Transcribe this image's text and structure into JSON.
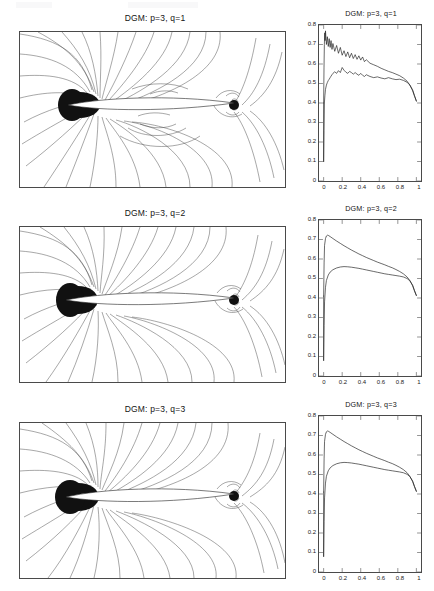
{
  "figure": {
    "rows": [
      {
        "id": "q1",
        "contour_title": "DGM: p=3, q=1",
        "line_title": "DGM: p=3, q=1"
      },
      {
        "id": "q2",
        "contour_title": "DGM: p=3, q=2",
        "line_title": "DGM: p=3, q=2"
      },
      {
        "id": "q3",
        "contour_title": "DGM: p=3, q=3",
        "line_title": "DGM: p=3, q=3"
      }
    ]
  },
  "axes": {
    "y_ticks": [
      "0.8",
      "0.7",
      "0.6",
      "0.5",
      "0.4",
      "0.3",
      "0.2",
      "0.1",
      "0"
    ],
    "x_ticks": [
      "0",
      "0.2",
      "0.4",
      "0.6",
      "0.8",
      "1"
    ]
  },
  "colors": {
    "curve": "#161616",
    "contour_line": "#3d3d3d",
    "axis": "#4a4a4a",
    "background": "#ffffff"
  },
  "chart_data": [
    {
      "type": "line",
      "title": "DGM: p=3, q=1",
      "xlabel": "",
      "ylabel": "",
      "xlim": [
        -0.05,
        1.05
      ],
      "ylim": [
        0,
        0.8
      ],
      "xticks": [
        0,
        0.2,
        0.4,
        0.6,
        0.8,
        1
      ],
      "yticks": [
        0,
        0.1,
        0.2,
        0.3,
        0.4,
        0.5,
        0.6,
        0.7,
        0.8
      ],
      "grid": false,
      "legend": "none",
      "note": "Oscillatory solution: strong sawtooth wiggles on both surfaces",
      "series": [
        {
          "name": "upper-surface",
          "x": [
            0.0,
            0.004,
            0.008,
            0.012,
            0.016,
            0.02,
            0.03,
            0.04,
            0.05,
            0.06,
            0.07,
            0.08,
            0.09,
            0.1,
            0.12,
            0.14,
            0.16,
            0.18,
            0.2,
            0.22,
            0.24,
            0.26,
            0.28,
            0.3,
            0.32,
            0.34,
            0.36,
            0.38,
            0.4,
            0.42,
            0.44,
            0.46,
            0.5,
            0.54,
            0.58,
            0.62,
            0.66,
            0.7,
            0.74,
            0.78,
            0.82,
            0.86,
            0.9,
            0.93,
            0.96,
            0.98,
            1.0
          ],
          "values": [
            0.4,
            0.58,
            0.7,
            0.76,
            0.72,
            0.77,
            0.7,
            0.74,
            0.69,
            0.73,
            0.685,
            0.72,
            0.675,
            0.705,
            0.665,
            0.695,
            0.655,
            0.685,
            0.645,
            0.668,
            0.638,
            0.662,
            0.632,
            0.655,
            0.628,
            0.648,
            0.624,
            0.642,
            0.62,
            0.636,
            0.612,
            0.622,
            0.604,
            0.596,
            0.588,
            0.578,
            0.57,
            0.562,
            0.556,
            0.548,
            0.54,
            0.528,
            0.512,
            0.492,
            0.462,
            0.435,
            0.41
          ]
        },
        {
          "name": "lower-surface",
          "x": [
            0.0,
            0.004,
            0.008,
            0.014,
            0.02,
            0.03,
            0.04,
            0.05,
            0.06,
            0.07,
            0.08,
            0.09,
            0.1,
            0.12,
            0.14,
            0.16,
            0.18,
            0.2,
            0.22,
            0.24,
            0.26,
            0.28,
            0.3,
            0.32,
            0.34,
            0.36,
            0.38,
            0.4,
            0.42,
            0.44,
            0.46,
            0.5,
            0.54,
            0.58,
            0.62,
            0.66,
            0.7,
            0.74,
            0.78,
            0.82,
            0.86,
            0.9,
            0.93,
            0.96,
            0.98,
            1.0
          ],
          "values": [
            0.1,
            0.26,
            0.4,
            0.44,
            0.47,
            0.492,
            0.505,
            0.515,
            0.522,
            0.53,
            0.538,
            0.545,
            0.552,
            0.56,
            0.552,
            0.566,
            0.556,
            0.582,
            0.568,
            0.558,
            0.552,
            0.562,
            0.556,
            0.548,
            0.556,
            0.548,
            0.542,
            0.552,
            0.542,
            0.536,
            0.545,
            0.536,
            0.53,
            0.534,
            0.528,
            0.524,
            0.53,
            0.524,
            0.52,
            0.522,
            0.516,
            0.506,
            0.492,
            0.468,
            0.438,
            0.41
          ]
        }
      ]
    },
    {
      "type": "line",
      "title": "DGM: p=3, q=2",
      "xlabel": "",
      "ylabel": "",
      "xlim": [
        -0.05,
        1.05
      ],
      "ylim": [
        0,
        0.8
      ],
      "xticks": [
        0,
        0.2,
        0.4,
        0.6,
        0.8,
        1
      ],
      "yticks": [
        0,
        0.1,
        0.2,
        0.3,
        0.4,
        0.5,
        0.6,
        0.7,
        0.8
      ],
      "grid": false,
      "legend": "none",
      "note": "Smooth monotone decay, no oscillations",
      "series": [
        {
          "name": "upper-surface",
          "x": [
            0.0,
            0.005,
            0.01,
            0.02,
            0.03,
            0.04,
            0.05,
            0.07,
            0.1,
            0.14,
            0.18,
            0.22,
            0.26,
            0.3,
            0.34,
            0.38,
            0.42,
            0.46,
            0.5,
            0.54,
            0.58,
            0.62,
            0.66,
            0.7,
            0.74,
            0.78,
            0.82,
            0.86,
            0.9,
            0.93,
            0.96,
            0.98,
            1.0
          ],
          "values": [
            0.41,
            0.58,
            0.67,
            0.705,
            0.718,
            0.722,
            0.721,
            0.715,
            0.705,
            0.692,
            0.68,
            0.668,
            0.657,
            0.646,
            0.636,
            0.626,
            0.617,
            0.608,
            0.6,
            0.592,
            0.584,
            0.577,
            0.57,
            0.562,
            0.555,
            0.546,
            0.536,
            0.524,
            0.508,
            0.49,
            0.462,
            0.436,
            0.412
          ]
        },
        {
          "name": "lower-surface",
          "x": [
            0.0,
            0.005,
            0.01,
            0.02,
            0.03,
            0.05,
            0.07,
            0.1,
            0.14,
            0.18,
            0.22,
            0.26,
            0.3,
            0.34,
            0.38,
            0.42,
            0.46,
            0.5,
            0.54,
            0.58,
            0.62,
            0.66,
            0.7,
            0.74,
            0.78,
            0.82,
            0.86,
            0.9,
            0.93,
            0.96,
            0.98,
            1.0
          ],
          "values": [
            0.08,
            0.26,
            0.38,
            0.455,
            0.49,
            0.518,
            0.533,
            0.545,
            0.554,
            0.559,
            0.561,
            0.56,
            0.558,
            0.555,
            0.552,
            0.548,
            0.544,
            0.54,
            0.536,
            0.532,
            0.528,
            0.524,
            0.521,
            0.518,
            0.515,
            0.512,
            0.508,
            0.5,
            0.488,
            0.466,
            0.438,
            0.414
          ]
        }
      ]
    },
    {
      "type": "line",
      "title": "DGM: p=3, q=3",
      "xlabel": "",
      "ylabel": "",
      "xlim": [
        -0.05,
        1.05
      ],
      "ylim": [
        0,
        0.8
      ],
      "xticks": [
        0,
        0.2,
        0.4,
        0.6,
        0.8,
        1
      ],
      "yticks": [
        0,
        0.1,
        0.2,
        0.3,
        0.4,
        0.5,
        0.6,
        0.7,
        0.8
      ],
      "grid": false,
      "legend": "none",
      "note": "Smooth monotone decay, essentially identical to q=2",
      "series": [
        {
          "name": "upper-surface",
          "x": [
            0.0,
            0.005,
            0.01,
            0.02,
            0.03,
            0.04,
            0.05,
            0.07,
            0.1,
            0.14,
            0.18,
            0.22,
            0.26,
            0.3,
            0.34,
            0.38,
            0.42,
            0.46,
            0.5,
            0.54,
            0.58,
            0.62,
            0.66,
            0.7,
            0.74,
            0.78,
            0.82,
            0.86,
            0.9,
            0.93,
            0.96,
            0.98,
            1.0
          ],
          "values": [
            0.41,
            0.58,
            0.67,
            0.706,
            0.719,
            0.723,
            0.722,
            0.716,
            0.706,
            0.693,
            0.681,
            0.669,
            0.658,
            0.647,
            0.637,
            0.627,
            0.618,
            0.609,
            0.601,
            0.593,
            0.585,
            0.578,
            0.571,
            0.563,
            0.556,
            0.547,
            0.537,
            0.525,
            0.509,
            0.491,
            0.463,
            0.437,
            0.413
          ]
        },
        {
          "name": "lower-surface",
          "x": [
            0.0,
            0.005,
            0.01,
            0.02,
            0.03,
            0.05,
            0.07,
            0.1,
            0.14,
            0.18,
            0.22,
            0.26,
            0.3,
            0.34,
            0.38,
            0.42,
            0.46,
            0.5,
            0.54,
            0.58,
            0.62,
            0.66,
            0.7,
            0.74,
            0.78,
            0.82,
            0.86,
            0.9,
            0.93,
            0.96,
            0.98,
            1.0
          ],
          "values": [
            0.08,
            0.26,
            0.38,
            0.456,
            0.491,
            0.519,
            0.534,
            0.546,
            0.555,
            0.56,
            0.562,
            0.561,
            0.559,
            0.556,
            0.553,
            0.549,
            0.545,
            0.541,
            0.537,
            0.533,
            0.529,
            0.525,
            0.522,
            0.519,
            0.516,
            0.513,
            0.509,
            0.501,
            0.489,
            0.467,
            0.439,
            0.415
          ]
        }
      ]
    }
  ]
}
